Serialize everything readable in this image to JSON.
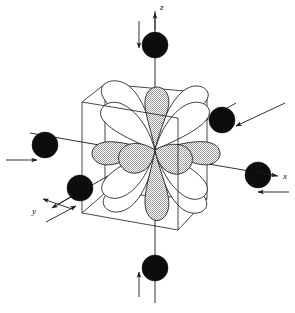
{
  "figure": {
    "projection": "oblique cabinet projection",
    "background_color": "#ffffff",
    "line_color": "#1a1a1a",
    "sphere_color": "#0d0d0d",
    "lobe_open_fill": "#ffffff",
    "lobe_shaded_fill": "#c8c8c8"
  },
  "axes": [
    {
      "id": "z",
      "label": "z",
      "label_x": 157,
      "label_y": 9,
      "direction": "up",
      "description": "vertical axis pointing up"
    },
    {
      "id": "x",
      "label": "x",
      "label_x": 283,
      "label_y": 178,
      "direction": "right",
      "description": "horizontal axis pointing right"
    },
    {
      "id": "y",
      "label": "y",
      "label_x": 34,
      "label_y": 215,
      "direction": "down-left",
      "description": "depth axis pointing toward viewer, lower left"
    }
  ],
  "cube": {
    "front_face": [
      [
        82,
        102
      ],
      [
        178,
        118
      ],
      [
        178,
        230
      ],
      [
        82,
        213
      ]
    ],
    "back_face": [
      [
        105,
        84
      ],
      [
        207,
        93
      ],
      [
        207,
        199
      ],
      [
        105,
        193
      ]
    ],
    "label": "coordinate cube"
  },
  "center": {
    "x": 155,
    "y": 150,
    "label": "central metal ion / orbital origin"
  },
  "ligands": [
    {
      "id": "ligand-z-top",
      "axis": "z",
      "cx": 155,
      "cy": 45,
      "r": 13,
      "arrow_from": [
        139,
        21
      ],
      "arrow_to": [
        139,
        48
      ]
    },
    {
      "id": "ligand-z-bottom",
      "axis": "z",
      "cx": 155,
      "cy": 268,
      "r": 13,
      "arrow_from": [
        139,
        297
      ],
      "arrow_to": [
        139,
        272
      ]
    },
    {
      "id": "ligand-x-left",
      "axis": "x",
      "cx": 45,
      "cy": 145,
      "r": 13,
      "arrow_from": [
        6,
        160
      ],
      "arrow_to": [
        37,
        160
      ]
    },
    {
      "id": "ligand-x-right",
      "axis": "x",
      "cx": 258,
      "cy": 175,
      "r": 13,
      "arrow_from": [
        289,
        192
      ],
      "arrow_to": [
        258,
        192
      ]
    },
    {
      "id": "ligand-y-back",
      "axis": "y",
      "cx": 222,
      "cy": 120,
      "r": 13,
      "arrow_from": [
        285,
        103
      ],
      "arrow_to": [
        236,
        126
      ]
    },
    {
      "id": "ligand-y-front",
      "axis": "y",
      "cx": 80,
      "cy": 188,
      "r": 13,
      "arrow_from": [
        46,
        222
      ],
      "arrow_to": [
        76,
        206
      ]
    }
  ],
  "orbital": {
    "type": "d-orbital lobe set",
    "lobe_count": 8,
    "lobes": [
      {
        "id": "lobe-up",
        "shading": "shaded",
        "angle_deg": -90
      },
      {
        "id": "lobe-upper-right",
        "shading": "open",
        "angle_deg": -45
      },
      {
        "id": "lobe-right",
        "shading": "shaded",
        "angle_deg": 0
      },
      {
        "id": "lobe-lower-right",
        "shading": "open",
        "angle_deg": 45
      },
      {
        "id": "lobe-down",
        "shading": "shaded",
        "angle_deg": 90
      },
      {
        "id": "lobe-lower-left",
        "shading": "open",
        "angle_deg": 135
      },
      {
        "id": "lobe-left",
        "shading": "shaded",
        "angle_deg": 180
      },
      {
        "id": "lobe-upper-left",
        "shading": "open",
        "angle_deg": -135
      }
    ]
  }
}
